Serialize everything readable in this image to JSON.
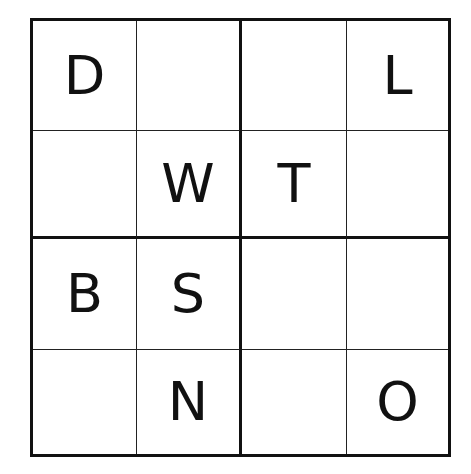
{
  "puzzle": {
    "type": "4x4 letter sudoku",
    "size": 4,
    "box_size": 2,
    "rows": [
      [
        "D",
        "",
        "",
        "L"
      ],
      [
        "",
        "W",
        "T",
        ""
      ],
      [
        "B",
        "S",
        "",
        ""
      ],
      [
        "",
        "N",
        "",
        "O"
      ]
    ]
  },
  "colors": {
    "background": "#ffffff",
    "grid_line": "#111111",
    "text": "#111111"
  }
}
